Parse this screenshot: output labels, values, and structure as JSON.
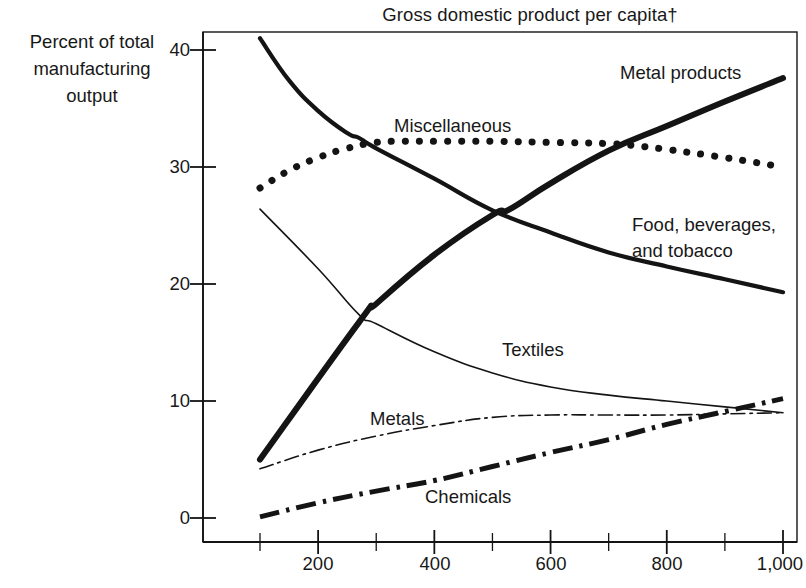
{
  "chart_data": {
    "type": "line",
    "title": "Gross domestic product per capita†",
    "xlabel": "",
    "ylabel": "Percent of total manufacturing output",
    "ylabel_lines": [
      "Percent of total",
      "manufacturing",
      "output"
    ],
    "xlim": [
      100,
      1000
    ],
    "ylim": [
      -1.5,
      41.5
    ],
    "grid": false,
    "legend_position": "inline-annotations",
    "x_ticks": [
      200,
      400,
      600,
      800,
      1000
    ],
    "x_tick_labels": [
      "200",
      "400",
      "600",
      "800",
      "1,000"
    ],
    "x_minor_ticks": [
      100,
      300,
      500,
      700,
      900
    ],
    "y_ticks": [
      0,
      10,
      20,
      30,
      40
    ],
    "y_tick_labels": [
      "0",
      "10",
      "20",
      "30",
      "40"
    ],
    "series": [
      {
        "name": "Food, beverages, and tobacco",
        "style": "thick-solid",
        "label": "Food, beverages,\nand tobacco",
        "label_line1": "Food, beverages,",
        "label_line2": "and tobacco",
        "x": [
          100,
          150,
          200,
          250,
          270,
          300,
          400,
          500,
          600,
          700,
          800,
          900,
          1000
        ],
        "values": [
          41.0,
          37.4,
          34.8,
          32.9,
          32.5,
          31.6,
          29.0,
          26.3,
          24.4,
          22.7,
          21.5,
          20.4,
          19.3
        ]
      },
      {
        "name": "Miscellaneous",
        "style": "thick-dotted",
        "label": "Miscellaneous",
        "x": [
          100,
          150,
          200,
          250,
          300,
          350,
          400,
          500,
          600,
          700,
          750,
          800,
          900,
          1000
        ],
        "values": [
          28.2,
          29.7,
          30.8,
          31.6,
          32.1,
          32.2,
          32.2,
          32.2,
          32.1,
          32.0,
          31.8,
          31.5,
          30.8,
          30.0
        ]
      },
      {
        "name": "Metal products",
        "style": "very-thick-solid",
        "label": "Metal products",
        "x": [
          100,
          270,
          300,
          400,
          500,
          530,
          600,
          700,
          800,
          900,
          1000
        ],
        "values": [
          5.0,
          16.7,
          18.3,
          22.5,
          25.9,
          26.4,
          28.6,
          31.4,
          33.5,
          35.6,
          37.6
        ]
      },
      {
        "name": "Textiles",
        "style": "thin-solid",
        "label": "Textiles",
        "x": [
          100,
          200,
          270,
          300,
          400,
          500,
          600,
          700,
          800,
          900,
          1000
        ],
        "values": [
          26.4,
          21.3,
          17.4,
          16.6,
          14.2,
          12.4,
          11.2,
          10.5,
          10.0,
          9.5,
          9.0
        ]
      },
      {
        "name": "Metals",
        "style": "thin-dashdot",
        "label": "Metals",
        "x": [
          100,
          200,
          300,
          400,
          500,
          600,
          700,
          800,
          900,
          1000
        ],
        "values": [
          4.2,
          5.8,
          7.0,
          7.9,
          8.6,
          8.8,
          8.8,
          8.8,
          8.9,
          9.0
        ]
      },
      {
        "name": "Chemicals",
        "style": "thick-dashdot",
        "label": "Chemicals",
        "x": [
          100,
          200,
          300,
          400,
          500,
          600,
          700,
          800,
          900,
          1000
        ],
        "values": [
          0.1,
          1.3,
          2.3,
          3.2,
          4.4,
          5.6,
          6.7,
          8.0,
          9.1,
          10.2
        ]
      }
    ],
    "annotations": [
      {
        "text": "Metal products",
        "x_px": 620,
        "y_px": 60
      },
      {
        "text": "Miscellaneous",
        "x_px": 394,
        "y_px": 113
      },
      {
        "text": "Food, beverages,",
        "x_px": 632,
        "y_px": 212
      },
      {
        "text": "and tobacco",
        "x_px": 632,
        "y_px": 238
      },
      {
        "text": "Textiles",
        "x_px": 502,
        "y_px": 337
      },
      {
        "text": "Metals",
        "x_px": 370,
        "y_px": 406
      },
      {
        "text": "Chemicals",
        "x_px": 425,
        "y_px": 484
      }
    ],
    "colors": {
      "ink": "#141414",
      "background": "#ffffff",
      "axis": "#141414"
    }
  }
}
